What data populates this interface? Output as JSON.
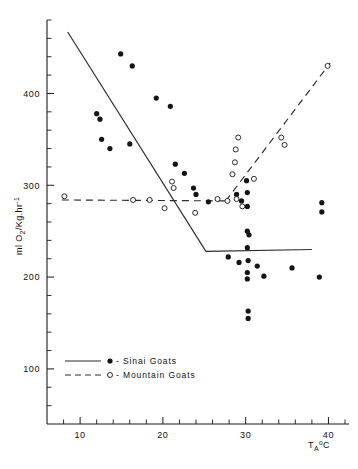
{
  "figure": {
    "name": "oxygen-consumption-vs-ambient-temperature",
    "background_color": "#ffffff",
    "ink_color": "#141414"
  },
  "chart_data": {
    "type": "scatter",
    "title": "",
    "subtitle": "",
    "xlabel": "T",
    "xlabel_sub": "A",
    "xlabel_sup": "o",
    "xlabel_tail": "C",
    "xlabel_full": "T_A °C",
    "ylabel_full": "ml O2/Kg.hr-1",
    "ylabel_parts": {
      "prefix": "ml O",
      "sub": "2",
      "mid": "/Kg.hr",
      "sup": "-1"
    },
    "grid": false,
    "legend_position": "bottom-left",
    "xlim": [
      6,
      42
    ],
    "ylim": [
      40,
      480
    ],
    "x_ticks_major": [
      10,
      20,
      30,
      40
    ],
    "x_tick_labels": [
      "10",
      "20",
      "30",
      "40"
    ],
    "x_tick_minor_step": 2,
    "y_ticks_major": [
      100,
      200,
      300,
      400
    ],
    "y_tick_labels": [
      "100",
      "200",
      "300",
      "400"
    ],
    "y_tick_minor_step": 20,
    "series": [
      {
        "name": "Sinai Goats",
        "marker": "filled-circle",
        "legend_symbol": "●",
        "legend_dash": "solid",
        "points": [
          [
            12.0,
            378
          ],
          [
            12.4,
            372
          ],
          [
            12.6,
            350
          ],
          [
            13.6,
            340
          ],
          [
            14.9,
            443
          ],
          [
            16.3,
            430
          ],
          [
            16.0,
            345
          ],
          [
            19.2,
            395
          ],
          [
            20.9,
            386
          ],
          [
            21.5,
            323
          ],
          [
            22.6,
            313
          ],
          [
            23.7,
            297
          ],
          [
            24.0,
            290
          ],
          [
            25.5,
            282
          ],
          [
            28.9,
            290
          ],
          [
            29.5,
            283
          ],
          [
            30.1,
            305
          ],
          [
            30.2,
            292
          ],
          [
            30.2,
            277
          ],
          [
            30.2,
            250
          ],
          [
            30.4,
            246
          ],
          [
            30.2,
            232
          ],
          [
            27.9,
            222
          ],
          [
            29.2,
            216
          ],
          [
            30.3,
            218
          ],
          [
            30.2,
            205
          ],
          [
            30.2,
            198
          ],
          [
            31.4,
            212
          ],
          [
            32.2,
            201
          ],
          [
            30.3,
            163
          ],
          [
            30.3,
            155
          ],
          [
            35.6,
            210
          ],
          [
            38.9,
            200
          ],
          [
            39.2,
            281
          ],
          [
            39.2,
            271
          ]
        ]
      },
      {
        "name": "Mountain Goats",
        "marker": "open-circle",
        "legend_symbol": "○",
        "legend_dash": "dashed",
        "points": [
          [
            8.1,
            288
          ],
          [
            16.4,
            284
          ],
          [
            18.4,
            284
          ],
          [
            20.2,
            275
          ],
          [
            21.1,
            304
          ],
          [
            21.3,
            297
          ],
          [
            23.9,
            270
          ],
          [
            26.6,
            285
          ],
          [
            27.8,
            283
          ],
          [
            28.9,
            285
          ],
          [
            29.6,
            277
          ],
          [
            28.4,
            312
          ],
          [
            28.7,
            325
          ],
          [
            28.8,
            339
          ],
          [
            29.1,
            352
          ],
          [
            31.0,
            307
          ],
          [
            34.3,
            352
          ],
          [
            34.7,
            344
          ],
          [
            39.9,
            430
          ]
        ]
      }
    ],
    "fit_lines": [
      {
        "name": "sinai-regression",
        "style": "solid",
        "segments": [
          {
            "x1": 8.5,
            "y1": 467,
            "x2": 25.2,
            "y2": 228
          },
          {
            "x1": 25.2,
            "y1": 228,
            "x2": 38.0,
            "y2": 230
          }
        ]
      },
      {
        "name": "mountain-regression",
        "style": "dashed",
        "segments": [
          {
            "x1": 7.8,
            "y1": 284,
            "x2": 27.6,
            "y2": 283
          },
          {
            "x1": 27.6,
            "y1": 283,
            "x2": 40.2,
            "y2": 433
          }
        ]
      }
    ],
    "legend_entries": [
      {
        "symbol": "●",
        "dash": "solid",
        "separator": "-",
        "label": "Sinai  Goats"
      },
      {
        "symbol": "○",
        "dash": "dashed",
        "separator": "-",
        "label": "Mountain  Goats"
      }
    ]
  }
}
